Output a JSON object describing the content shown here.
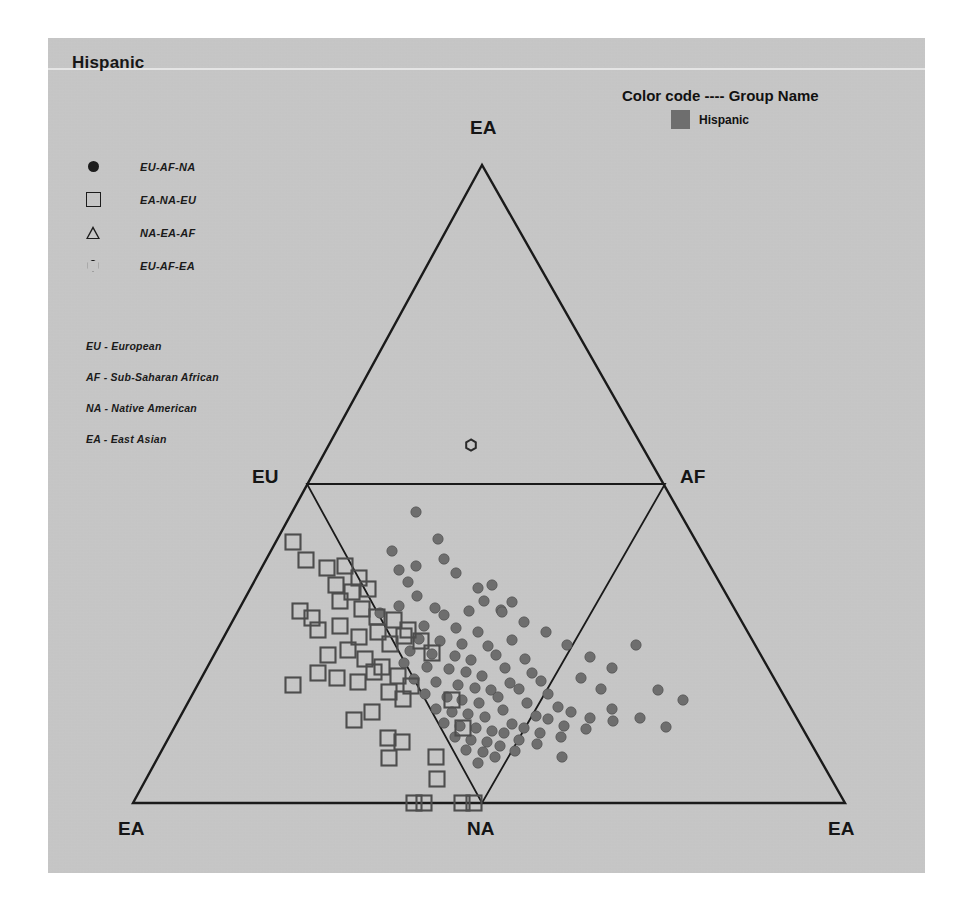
{
  "title": "Hispanic",
  "color_code": {
    "heading": "Color code ---- Group Name",
    "entries": [
      {
        "label": "Hispanic",
        "color": "#6e6e6e"
      }
    ]
  },
  "shape_legend": {
    "items": [
      {
        "glyph": "filled-circle-icon",
        "label": "EU-AF-NA"
      },
      {
        "glyph": "open-square-icon",
        "label": "EA-NA-EU"
      },
      {
        "glyph": "open-triangle-icon",
        "label": "NA-EA-AF"
      },
      {
        "glyph": "open-hexagon-icon",
        "label": "EU-AF-EA"
      }
    ]
  },
  "abbreviation_key": {
    "items": [
      "EU - European",
      "AF - Sub-Saharan African",
      "NA - Native American",
      "EA - East Asian"
    ]
  },
  "chart_data": {
    "type": "scatter",
    "plot_kind": "ternary-triple-simplex",
    "title": "Hispanic",
    "xlabel": "",
    "ylabel": "",
    "grid": false,
    "legend_position": "top-right",
    "axis_vertices": {
      "apex_top": "EA",
      "bottom_left": "EA",
      "bottom_center": "NA",
      "bottom_right": "EA",
      "mid_left": "EU",
      "mid_right": "AF"
    },
    "geometry": {
      "outer_triangle": [
        [
          482,
          165
        ],
        [
          133,
          803
        ],
        [
          845,
          803
        ]
      ],
      "inner_triangle": [
        [
          307,
          484
        ],
        [
          665,
          484
        ],
        [
          482,
          803
        ]
      ]
    },
    "series": [
      {
        "name": "EU-AF-NA",
        "marker": "filled-circle",
        "color": "#6e6e6e",
        "points": [
          [
            416,
            512
          ],
          [
            392,
            551
          ],
          [
            438,
            539
          ],
          [
            444,
            559
          ],
          [
            456,
            573
          ],
          [
            408,
            582
          ],
          [
            492,
            585
          ],
          [
            484,
            601
          ],
          [
            417,
            596
          ],
          [
            399,
            606
          ],
          [
            435,
            608
          ],
          [
            380,
            613
          ],
          [
            444,
            615
          ],
          [
            469,
            611
          ],
          [
            501,
            610
          ],
          [
            424,
            626
          ],
          [
            456,
            628
          ],
          [
            478,
            632
          ],
          [
            419,
            639
          ],
          [
            440,
            641
          ],
          [
            462,
            644
          ],
          [
            488,
            646
          ],
          [
            410,
            651
          ],
          [
            432,
            654
          ],
          [
            455,
            656
          ],
          [
            471,
            660
          ],
          [
            496,
            655
          ],
          [
            512,
            640
          ],
          [
            404,
            663
          ],
          [
            427,
            667
          ],
          [
            449,
            669
          ],
          [
            466,
            672
          ],
          [
            482,
            676
          ],
          [
            505,
            668
          ],
          [
            525,
            659
          ],
          [
            414,
            679
          ],
          [
            436,
            682
          ],
          [
            458,
            685
          ],
          [
            475,
            688
          ],
          [
            491,
            690
          ],
          [
            510,
            683
          ],
          [
            532,
            673
          ],
          [
            425,
            694
          ],
          [
            447,
            697
          ],
          [
            462,
            700
          ],
          [
            479,
            703
          ],
          [
            498,
            697
          ],
          [
            519,
            689
          ],
          [
            541,
            681
          ],
          [
            436,
            709
          ],
          [
            452,
            712
          ],
          [
            468,
            714
          ],
          [
            485,
            717
          ],
          [
            503,
            710
          ],
          [
            527,
            703
          ],
          [
            548,
            694
          ],
          [
            444,
            723
          ],
          [
            460,
            726
          ],
          [
            476,
            728
          ],
          [
            492,
            731
          ],
          [
            512,
            724
          ],
          [
            536,
            716
          ],
          [
            558,
            707
          ],
          [
            455,
            737
          ],
          [
            471,
            740
          ],
          [
            487,
            742
          ],
          [
            504,
            733
          ],
          [
            524,
            728
          ],
          [
            548,
            719
          ],
          [
            571,
            712
          ],
          [
            466,
            750
          ],
          [
            483,
            752
          ],
          [
            500,
            746
          ],
          [
            519,
            740
          ],
          [
            540,
            733
          ],
          [
            564,
            726
          ],
          [
            590,
            718
          ],
          [
            478,
            763
          ],
          [
            495,
            757
          ],
          [
            515,
            751
          ],
          [
            537,
            744
          ],
          [
            561,
            737
          ],
          [
            586,
            729
          ],
          [
            613,
            721
          ],
          [
            502,
            612
          ],
          [
            512,
            602
          ],
          [
            399,
            570
          ],
          [
            416,
            566
          ],
          [
            478,
            588
          ],
          [
            524,
            622
          ],
          [
            546,
            632
          ],
          [
            567,
            645
          ],
          [
            590,
            657
          ],
          [
            612,
            668
          ],
          [
            636,
            645
          ],
          [
            658,
            690
          ],
          [
            683,
            700
          ],
          [
            562,
            757
          ],
          [
            612,
            709
          ],
          [
            640,
            718
          ],
          [
            666,
            727
          ],
          [
            601,
            689
          ],
          [
            581,
            678
          ]
        ]
      },
      {
        "name": "EA-NA-EU",
        "marker": "open-square",
        "color": "#4d4d4d",
        "points": [
          [
            293,
            542
          ],
          [
            306,
            560
          ],
          [
            327,
            568
          ],
          [
            345,
            566
          ],
          [
            359,
            578
          ],
          [
            336,
            585
          ],
          [
            352,
            592
          ],
          [
            368,
            589
          ],
          [
            318,
            630
          ],
          [
            340,
            626
          ],
          [
            359,
            637
          ],
          [
            378,
            632
          ],
          [
            390,
            644
          ],
          [
            404,
            636
          ],
          [
            318,
            673
          ],
          [
            293,
            685
          ],
          [
            337,
            678
          ],
          [
            358,
            682
          ],
          [
            374,
            672
          ],
          [
            389,
            692
          ],
          [
            403,
            699
          ],
          [
            372,
            712
          ],
          [
            354,
            720
          ],
          [
            388,
            738
          ],
          [
            402,
            742
          ],
          [
            389,
            758
          ],
          [
            436,
            757
          ],
          [
            437,
            779
          ],
          [
            414,
            803
          ],
          [
            424,
            803
          ],
          [
            462,
            803
          ],
          [
            474,
            803
          ],
          [
            340,
            601
          ],
          [
            362,
            609
          ],
          [
            377,
            617
          ],
          [
            394,
            620
          ],
          [
            408,
            630
          ],
          [
            421,
            641
          ],
          [
            432,
            653
          ],
          [
            348,
            650
          ],
          [
            365,
            659
          ],
          [
            382,
            667
          ],
          [
            398,
            676
          ],
          [
            411,
            686
          ],
          [
            300,
            611
          ],
          [
            312,
            618
          ],
          [
            328,
            655
          ],
          [
            452,
            700
          ],
          [
            463,
            728
          ]
        ]
      },
      {
        "name": "NA-EA-AF",
        "marker": "open-triangle",
        "color": "#4d4d4d",
        "points": []
      },
      {
        "name": "EU-AF-EA",
        "marker": "open-hexagon",
        "color": "#4d4d4d",
        "points": [
          [
            471,
            445
          ]
        ]
      }
    ]
  }
}
